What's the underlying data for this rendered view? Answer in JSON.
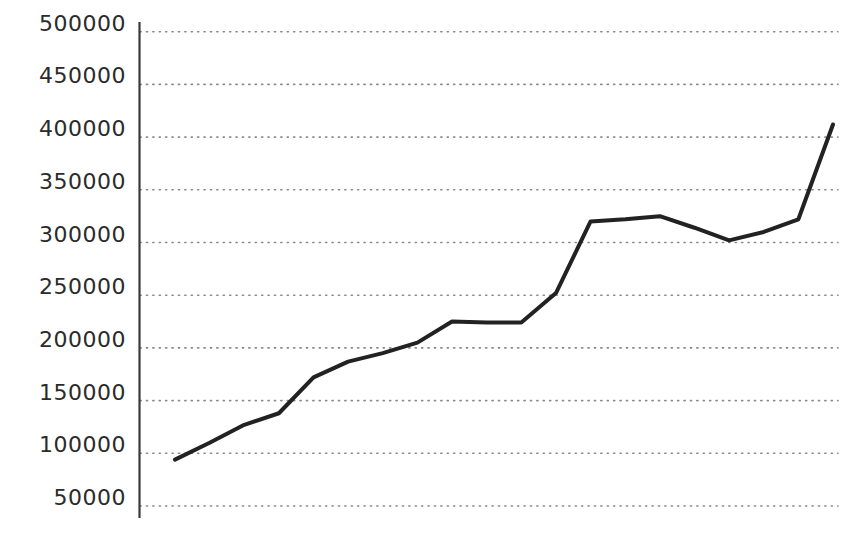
{
  "chart_data": {
    "type": "line",
    "title": "",
    "subtitle": "",
    "xlabel": "",
    "ylabel": "",
    "legend": [],
    "legend_position": "none",
    "grid": true,
    "grid_style": "dotted-horizontal",
    "x_axis_visible": false,
    "y_axis_visible": true,
    "ylim": [
      50000,
      500000
    ],
    "yticks": [
      500000,
      450000,
      400000,
      350000,
      300000,
      250000,
      200000,
      150000,
      100000,
      50000
    ],
    "ytick_labels": [
      "500000",
      "450000",
      "400000",
      "350000",
      "300000",
      "250000",
      "200000",
      "150000",
      "100000",
      "50000"
    ],
    "xticks": [],
    "xtick_labels": [],
    "series": [
      {
        "name": "series-1",
        "color": "#222222",
        "line_width": 4,
        "x": [
          1,
          2,
          3,
          4,
          5,
          6,
          7,
          8,
          9,
          10,
          11,
          12,
          13,
          14,
          15,
          16,
          17,
          18,
          19,
          20
        ],
        "values": [
          94000,
          110000,
          127000,
          138000,
          172000,
          187000,
          195000,
          205000,
          225000,
          224000,
          224000,
          252000,
          320000,
          322000,
          325000,
          314000,
          302000,
          310000,
          322000,
          412000
        ]
      }
    ]
  },
  "style": {
    "background": "#ffffff",
    "axis_color": "#3a3a3a",
    "grid_color": "#8a8a8a",
    "label_color": "#2b2b2b",
    "line_color": "#222222"
  },
  "geometry": {
    "plot_left": 140,
    "plot_right": 838,
    "y_top_px": 31.7,
    "y_bottom_px": 506,
    "axis_top_px": 22,
    "axis_bottom_px": 518,
    "x_first_px": 175,
    "x_last_px": 833
  }
}
